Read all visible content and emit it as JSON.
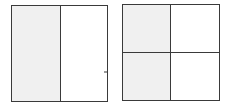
{
  "diagram": {
    "type": "fraction-area-models",
    "colors": {
      "stroke": "#3a3a3a",
      "shaded": "#f0f0f0",
      "unshaded": "#ffffff"
    },
    "figures": [
      {
        "id": "halves",
        "rows": 1,
        "cols": 2,
        "cells": [
          {
            "row": 0,
            "col": 0,
            "shaded": true
          },
          {
            "row": 0,
            "col": 1,
            "shaded": false
          }
        ],
        "shaded_count": 1,
        "total_parts": 2
      },
      {
        "id": "quarters",
        "rows": 2,
        "cols": 2,
        "cells": [
          {
            "row": 0,
            "col": 0,
            "shaded": true
          },
          {
            "row": 0,
            "col": 1,
            "shaded": false
          },
          {
            "row": 1,
            "col": 0,
            "shaded": true
          },
          {
            "row": 1,
            "col": 1,
            "shaded": false
          }
        ],
        "shaded_count": 2,
        "total_parts": 4
      }
    ]
  }
}
